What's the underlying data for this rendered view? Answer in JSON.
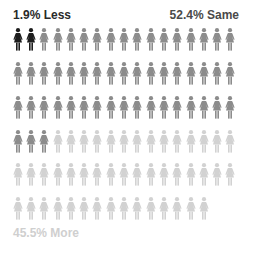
{
  "chart_data": {
    "type": "pictogram",
    "title": "",
    "total_icons": 100,
    "icons_per_row": 17,
    "icon": "woman-icon",
    "categories": [
      "Less",
      "Same",
      "More"
    ],
    "values": [
      1.9,
      52.4,
      45.5
    ],
    "icon_counts": [
      2,
      52,
      46
    ],
    "colors": [
      "#1c1c1c",
      "#8c8c8c",
      "#d2d2d2"
    ],
    "labels": [
      "1.9% Less",
      "52.4% Same",
      "45.5% More"
    ]
  },
  "labels": {
    "less": "1.9% Less",
    "same": "52.4% Same",
    "more": "45.5% More"
  }
}
